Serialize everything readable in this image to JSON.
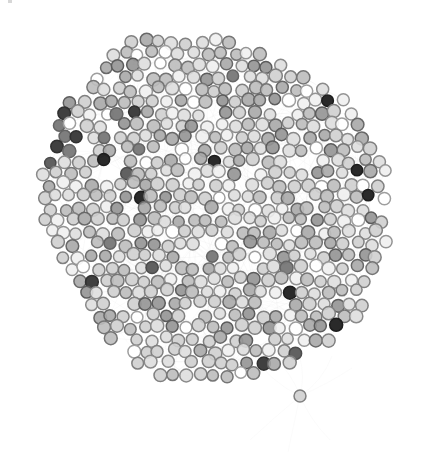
{
  "figure": {
    "kind": "network-graph",
    "title": "",
    "background_color": "#ffffff",
    "width": 429,
    "height": 460
  },
  "style": {
    "node_radius": 6.1,
    "node_stroke_width": 1.5,
    "edge_color": "#d9d9d9",
    "edge_opacity": 0.38,
    "edge_width": 0.65,
    "node_stroke_darken": 0.62,
    "palette": {
      "white": "#ffffff",
      "very_light": "#efefef",
      "light": "#dedede",
      "light_mid": "#cfcfcf",
      "mid": "#bdbdbd",
      "mid_dark": "#a8a8a8",
      "gray": "#949494",
      "dark_gray": "#7a7a7a",
      "darker": "#5c5c5c",
      "very_dark": "#3a3a3a",
      "near_black": "#232323"
    }
  },
  "chart_data": {
    "type": "scatter",
    "title": "",
    "xlabel": "",
    "ylabel": "",
    "grid": false,
    "legend": false,
    "xlim": [
      0,
      429
    ],
    "ylim": [
      0,
      460
    ],
    "node_count_approx": 760,
    "layout": {
      "algorithm": "force-directed",
      "center_x": 214,
      "center_y": 215,
      "radius_x": 170,
      "radius_y": 188
    },
    "cluster_notes": [
      "dense circular core occupying most of the frame",
      "dark-node cluster at upper-left rim near (40-90, 110-170)",
      "dark-node cluster at bottom-center near (155-215, 395-450)",
      "pair of near-black nodes at (290,360) and (300,360)",
      "single pendant node below-right at (300,395) joined by faint long edges",
      "faint long edge arcs bulge beyond the rim on left and right sides"
    ]
  }
}
